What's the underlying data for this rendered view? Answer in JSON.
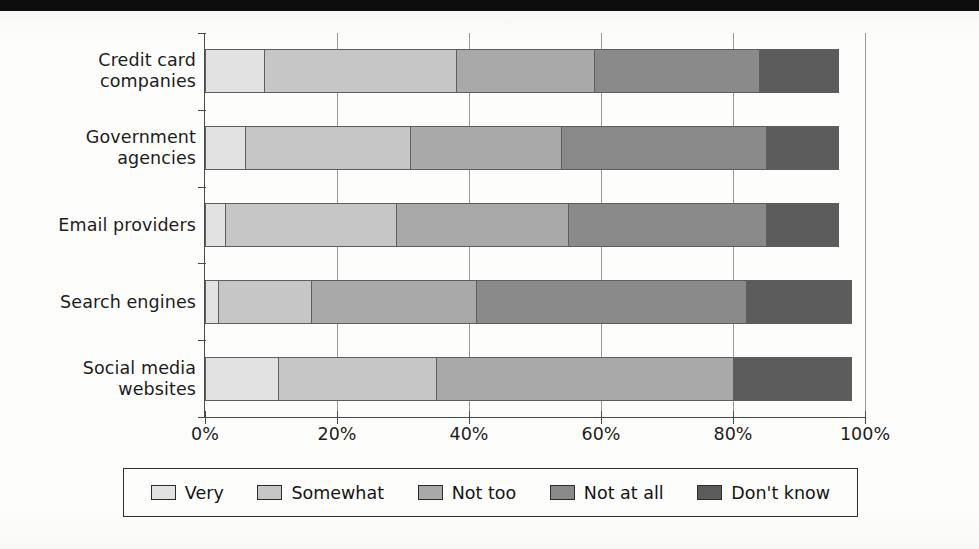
{
  "chart_data": {
    "type": "bar",
    "orientation": "horizontal",
    "stacked": true,
    "normalized_percent": true,
    "title": "",
    "subtitle": "",
    "xlabel": "",
    "ylabel": "",
    "xlim": [
      0,
      100
    ],
    "xticks": [
      0,
      20,
      40,
      60,
      80,
      100
    ],
    "xtick_labels": [
      "0%",
      "20%",
      "40%",
      "60%",
      "80%",
      "100%"
    ],
    "grid": "vertical",
    "legend_position": "bottom",
    "categories": [
      "Credit card\ncompanies",
      "Government\nagencies",
      "Email providers",
      "Search engines",
      "Social media\nwebsites"
    ],
    "category_labels_flat": [
      "Credit card companies",
      "Government agencies",
      "Email providers",
      "Search engines",
      "Social media websites"
    ],
    "series": [
      {
        "name": "Very",
        "color": "#e2e2e2",
        "values": [
          9,
          6,
          3,
          2,
          11
        ]
      },
      {
        "name": "Somewhat",
        "color": "#c6c6c6",
        "values": [
          29,
          25,
          26,
          14,
          24
        ]
      },
      {
        "name": "Not too",
        "color": "#a9a9a9",
        "values": [
          21,
          23,
          26,
          25,
          45
        ]
      },
      {
        "name": "Not at all",
        "color": "#8a8a8a",
        "values": [
          25,
          31,
          30,
          41,
          0
        ]
      },
      {
        "name": "Don't know",
        "color": "#5c5c5c",
        "values": [
          12,
          11,
          11,
          16,
          18
        ]
      }
    ],
    "cumulative_boundaries_percent": [
      [
        9,
        38,
        59,
        84,
        96
      ],
      [
        6,
        31,
        54,
        85,
        96
      ],
      [
        3,
        29,
        55,
        85,
        96
      ],
      [
        2,
        16,
        41,
        82,
        98
      ],
      [
        11,
        35,
        80,
        80,
        98
      ]
    ],
    "row_totals_percent": [
      96,
      96,
      96,
      98,
      98
    ]
  },
  "legend": {
    "entries": [
      {
        "label": "Very",
        "color": "#e2e2e2"
      },
      {
        "label": "Somewhat",
        "color": "#c6c6c6"
      },
      {
        "label": "Not too",
        "color": "#a9a9a9"
      },
      {
        "label": "Not at all",
        "color": "#8a8a8a"
      },
      {
        "label": "Don't know",
        "color": "#5c5c5c"
      }
    ]
  }
}
